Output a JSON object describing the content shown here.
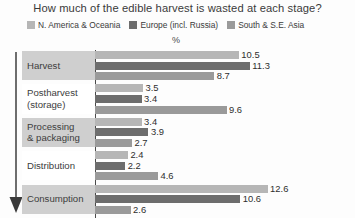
{
  "chart_data": {
    "type": "bar",
    "orientation": "horizontal",
    "title": "How much of the edible harvest is wasted at each stage?",
    "xlabel": "%",
    "ylabel": "",
    "axis_unit": "%",
    "grid": false,
    "legend_position": "top-left",
    "xlim": [
      0,
      13.5
    ],
    "categories": [
      "Harvest",
      "Postharvest (storage)",
      "Processing & packaging",
      "Distribution",
      "Consumption"
    ],
    "series": [
      {
        "name": "N. America & Oceania",
        "color": "#b6b6b6",
        "values": [
          10.5,
          3.5,
          3.4,
          2.4,
          12.6
        ]
      },
      {
        "name": "Europe (incl. Russia)",
        "color": "#6d6d6d",
        "values": [
          11.3,
          3.4,
          3.9,
          2.2,
          10.6
        ]
      },
      {
        "name": "South & S.E. Asia",
        "color": "#9a9a9a",
        "values": [
          8.7,
          9.6,
          2.7,
          4.6,
          2.6
        ]
      }
    ]
  },
  "groups": [
    {
      "label_line1": "Harvest",
      "label_line2": "",
      "shaded": true,
      "bars": [
        {
          "value": "10.5",
          "series": "N. America & Oceania"
        },
        {
          "value": "11.3",
          "series": "Europe (incl. Russia)"
        },
        {
          "value": "8.7",
          "series": "South & S.E. Asia"
        }
      ]
    },
    {
      "label_line1": "Postharvest",
      "label_line2": "(storage)",
      "shaded": false,
      "bars": [
        {
          "value": "3.5",
          "series": "N. America & Oceania"
        },
        {
          "value": "3.4",
          "series": "Europe (incl. Russia)"
        },
        {
          "value": "9.6",
          "series": "South & S.E. Asia"
        }
      ]
    },
    {
      "label_line1": "Processing",
      "label_line2": "& packaging",
      "shaded": true,
      "bars": [
        {
          "value": "3.4",
          "series": "N. America & Oceania"
        },
        {
          "value": "3.9",
          "series": "Europe (incl. Russia)"
        },
        {
          "value": "2.7",
          "series": "South & S.E. Asia"
        }
      ]
    },
    {
      "label_line1": "Distribution",
      "label_line2": "",
      "shaded": false,
      "bars": [
        {
          "value": "2.4",
          "series": "N. America & Oceania"
        },
        {
          "value": "2.2",
          "series": "Europe (incl. Russia)"
        },
        {
          "value": "4.6",
          "series": "South & S.E. Asia"
        }
      ]
    },
    {
      "label_line1": "Consumption",
      "label_line2": "",
      "shaded": true,
      "bars": [
        {
          "value": "12.6",
          "series": "N. America & Oceania"
        },
        {
          "value": "10.6",
          "series": "Europe (incl. Russia)"
        },
        {
          "value": "2.6",
          "series": "South & S.E. Asia"
        }
      ]
    }
  ],
  "arrow": {
    "name": "stage-progression-arrow",
    "direction": "down",
    "color": "#4a4a4a"
  }
}
